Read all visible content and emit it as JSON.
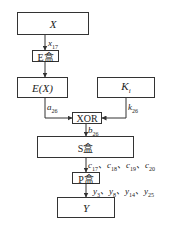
{
  "diagram": {
    "nodes": {
      "x": {
        "label": "X"
      },
      "e_box": {
        "label": "E盒"
      },
      "ex": {
        "label": "E(X)"
      },
      "ki": {
        "label": "K",
        "sub": "i"
      },
      "xor": {
        "label": "XOR"
      },
      "s_box": {
        "label": "S盒"
      },
      "p_box": {
        "label": "P盒"
      },
      "y": {
        "label": "Y"
      }
    },
    "edges": {
      "x_to_e": {
        "var": "x",
        "sub": "17"
      },
      "ex_to_xor": {
        "var": "a",
        "sub": "26"
      },
      "ki_to_xor": {
        "var": "k",
        "sub": "26"
      },
      "xor_to_s": {
        "var": "b",
        "sub": "26"
      },
      "s_to_p": {
        "items": [
          {
            "var": "c",
            "sub": "17"
          },
          {
            "var": "c",
            "sub": "18"
          },
          {
            "var": "c",
            "sub": "19"
          },
          {
            "var": "c",
            "sub": "20"
          }
        ]
      },
      "p_to_y": {
        "items": [
          {
            "var": "y",
            "sub": "3"
          },
          {
            "var": "y",
            "sub": "8"
          },
          {
            "var": "y",
            "sub": "14"
          },
          {
            "var": "y",
            "sub": "25"
          }
        ]
      }
    },
    "separator": "、"
  }
}
